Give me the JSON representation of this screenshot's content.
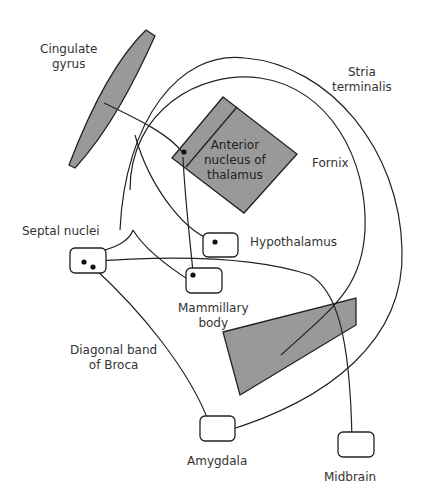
{
  "colors": {
    "structure_fill": "#999999",
    "line": "#222222",
    "text": "#333333"
  },
  "labels": {
    "cingulate_gyrus": [
      "Cingulate",
      "gyrus"
    ],
    "anterior_nucleus": [
      "Anterior",
      "nucleus of",
      "thalamus"
    ],
    "stria_terminalis": [
      "Stria",
      "terminalis"
    ],
    "fornix": "Fornix",
    "septal_nuclei": "Septal nuclei",
    "hypothalamus": "Hypothalamus",
    "mammillary_body": [
      "Mammillary",
      "body"
    ],
    "diagonal_band": [
      "Diagonal band",
      "of Broca"
    ],
    "amygdala": "Amygdala",
    "midbrain": "Midbrain"
  }
}
